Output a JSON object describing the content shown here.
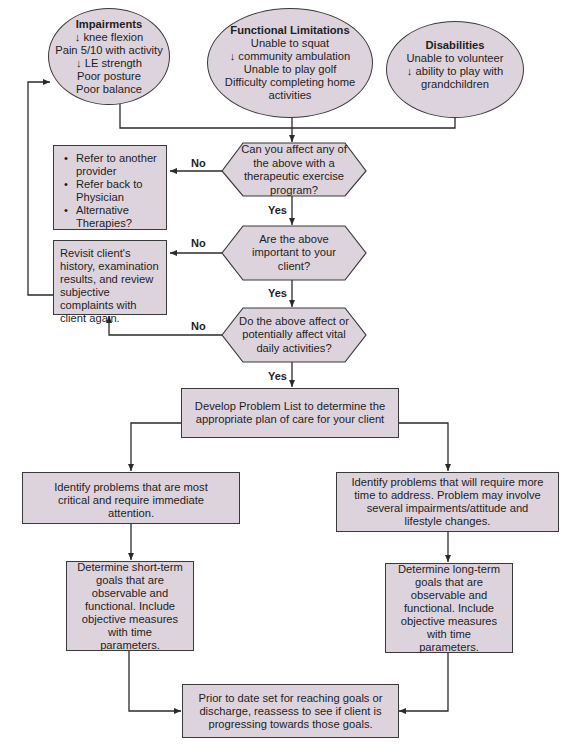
{
  "diagram": {
    "type": "flowchart",
    "colors": {
      "node_fill": "#ddd3dc",
      "stroke": "#3a3a3a",
      "text": "#1e1e1e",
      "background": "#ffffff"
    },
    "ovals": [
      {
        "id": "impairments",
        "title": "Impairments",
        "lines": [
          "↓ knee flexion",
          "Pain 5/10 with activity",
          "↓ LE strength",
          "Poor posture",
          "Poor balance"
        ]
      },
      {
        "id": "functional-limitations",
        "title": "Functional Limitations",
        "lines": [
          "Unable to squat",
          "↓ community ambulation",
          "Unable to play golf",
          "Difficulty completing home",
          "activities"
        ]
      },
      {
        "id": "disabilities",
        "title": "Disabilities",
        "lines": [
          "Unable to volunteer",
          "↓ ability to play with",
          "grandchildren"
        ]
      }
    ],
    "decisions": [
      {
        "id": "decision-1",
        "text": "Can you affect any of the above with a therapeutic exercise program?",
        "no_label": "No",
        "yes_label": "Yes"
      },
      {
        "id": "decision-2",
        "text": "Are the above important to your client?",
        "no_label": "No",
        "yes_label": "Yes"
      },
      {
        "id": "decision-3",
        "text": "Do the above affect or potentially affect vital daily activities?",
        "no_label": "No",
        "yes_label": "Yes"
      }
    ],
    "referral_box": {
      "items": [
        "Refer to another provider",
        "Refer back to Physician",
        "Alternative Therapies?"
      ]
    },
    "revisit_box": {
      "text": "Revisit client's history, examination results, and review subjective complaints with client again."
    },
    "problem_list_box": {
      "text": "Develop Problem List to determine the appropriate plan of care for your client"
    },
    "critical_box": {
      "text": "Identify problems that are most critical and require immediate attention."
    },
    "long_time_box": {
      "text": "Identify problems that will require more time to address. Problem may involve several impairments/attitude and lifestyle changes."
    },
    "short_term_box": {
      "text": "Determine short-term goals that are observable and functional. Include objective measures with time parameters."
    },
    "long_term_box": {
      "text": "Determine long-term goals that are observable and functional. Include objective measures with time parameters."
    },
    "reassess_box": {
      "text": "Prior to date set for reaching goals or discharge, reassess to see if client is progressing towards those goals."
    }
  }
}
